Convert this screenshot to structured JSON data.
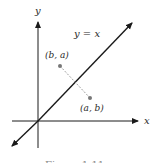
{
  "diagram": {
    "axes": {
      "x_label": "x",
      "y_label": "y"
    },
    "line_label": "y = x",
    "points": [
      {
        "label": "(b, a)",
        "x": 60,
        "y": 66
      },
      {
        "label": "(a, b)",
        "x": 90,
        "y": 98
      }
    ],
    "caption": "Figure 1.11",
    "colors": {
      "ink": "#1a1a1a",
      "point": "#777777",
      "segment": "#888888"
    }
  }
}
